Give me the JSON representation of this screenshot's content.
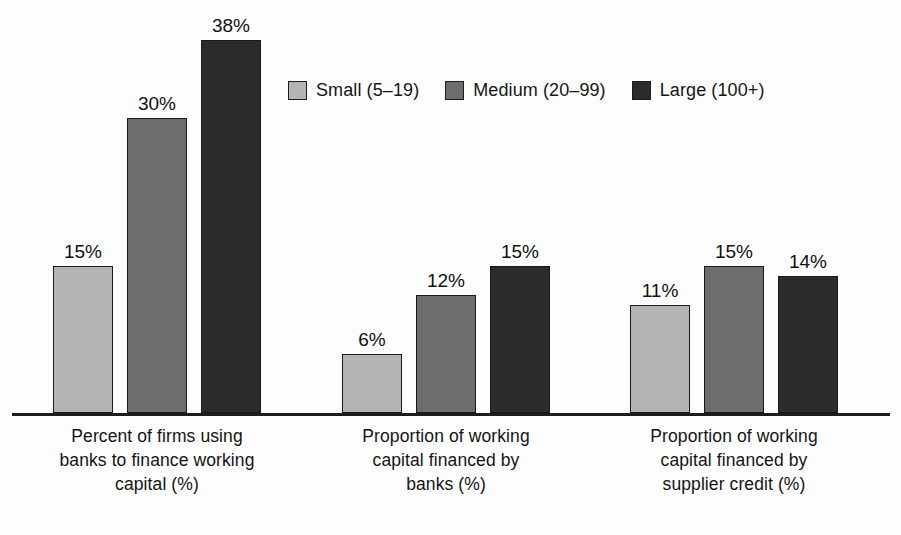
{
  "chart_data": {
    "type": "bar",
    "title": "",
    "subtitle": "",
    "xlabel": "",
    "ylabel": "",
    "ylim": [
      0,
      42
    ],
    "grid": false,
    "legend_position": "top-center",
    "value_label_suffix": "%",
    "categories": [
      "Percent of firms using banks to finance working capital (%)",
      "Proportion of working capital financed by banks (%)",
      "Proportion of working capital financed by supplier credit (%)"
    ],
    "series": [
      {
        "name": "Small (5–19)",
        "color": "#b4b4b4",
        "values": [
          15,
          6,
          11
        ]
      },
      {
        "name": "Medium (20–99)",
        "color": "#6d6d6d",
        "values": [
          30,
          12,
          15
        ]
      },
      {
        "name": "Large (100+)",
        "color": "#2b2b2b",
        "values": [
          38,
          15,
          14
        ]
      }
    ]
  },
  "legend": {
    "items": [
      {
        "label": "Small (5–19)",
        "swatch_color": "#b4b4b4",
        "swatch_name": "legend-swatch-small"
      },
      {
        "label": "Medium (20–99)",
        "swatch_color": "#6d6d6d",
        "swatch_name": "legend-swatch-medium"
      },
      {
        "label": "Large (100+)",
        "swatch_color": "#2b2b2b",
        "swatch_name": "legend-swatch-large"
      }
    ]
  },
  "groups": [
    {
      "label_lines": [
        "Percent of firms using",
        "banks to finance working",
        "capital (%)"
      ],
      "bars": [
        {
          "series": "Small (5–19)",
          "value": 15,
          "value_label": "15%",
          "tone": "small"
        },
        {
          "series": "Medium (20–99)",
          "value": 30,
          "value_label": "30%",
          "tone": "medium"
        },
        {
          "series": "Large (100+)",
          "value": 38,
          "value_label": "38%",
          "tone": "large"
        }
      ]
    },
    {
      "label_lines": [
        "Proportion of working",
        "capital financed by",
        "banks (%)"
      ],
      "bars": [
        {
          "series": "Small (5–19)",
          "value": 6,
          "value_label": "6%",
          "tone": "small"
        },
        {
          "series": "Medium (20–99)",
          "value": 12,
          "value_label": "12%",
          "tone": "medium"
        },
        {
          "series": "Large (100+)",
          "value": 15,
          "value_label": "15%",
          "tone": "large"
        }
      ]
    },
    {
      "label_lines": [
        "Proportion of working",
        "capital financed by",
        "supplier credit (%)"
      ],
      "bars": [
        {
          "series": "Small (5–19)",
          "value": 11,
          "value_label": "11%",
          "tone": "small"
        },
        {
          "series": "Medium (20–99)",
          "value": 15,
          "value_label": "15%",
          "tone": "medium"
        },
        {
          "series": "Large (100+)",
          "value": 14,
          "value_label": "14%",
          "tone": "large"
        }
      ]
    }
  ],
  "axis": {
    "baseline_color": "#1d1d1d"
  },
  "layout": {
    "bar_width": 60,
    "bar_gap": 14,
    "group_starts": [
      53,
      342,
      630
    ],
    "px_per_unit": 9.82,
    "baseline_y": 413,
    "label_tops": [
      424,
      424,
      424
    ]
  }
}
